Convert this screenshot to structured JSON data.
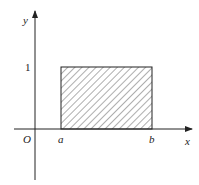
{
  "diagram": {
    "type": "rectangle-region-on-axes",
    "labels": {
      "y_axis": "y",
      "x_axis": "x",
      "origin": "O",
      "a": "a",
      "b": "b",
      "height": "1"
    },
    "region": {
      "fill": "diagonal-hatch",
      "x_from": "a",
      "x_to": "b",
      "y_from": 0,
      "y_to": 1
    },
    "colors": {
      "line": "#222222",
      "background": "#ffffff"
    }
  }
}
